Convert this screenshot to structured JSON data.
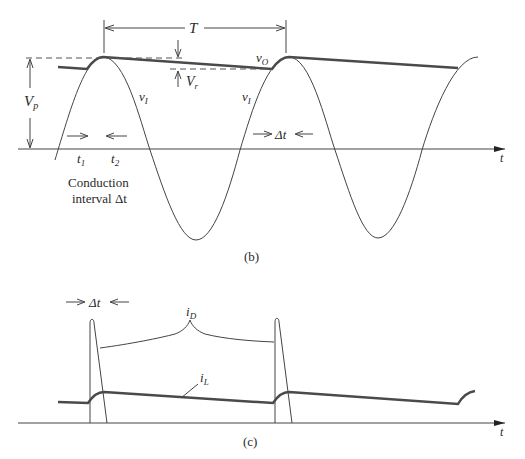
{
  "figure_b": {
    "caption": "(b)",
    "period_label": "T",
    "peak_label": "V",
    "peak_sub": "p",
    "ripple_label": "V",
    "ripple_sub": "r",
    "output_label": "v",
    "output_sub": "O",
    "input_label_1": "v",
    "input_sub_1": "I",
    "input_label_2": "v",
    "input_sub_2": "I",
    "t1_label": "t",
    "t1_sub": "1",
    "t2_label": "t",
    "t2_sub": "2",
    "delta_t_label": "Δt",
    "conduction_line1": "Conduction",
    "conduction_line2": "interval Δt",
    "axis_label": "t"
  },
  "figure_c": {
    "caption": "(c)",
    "delta_t_label": "Δt",
    "diode_current_label": "i",
    "diode_current_sub": "D",
    "load_current_label": "i",
    "load_current_sub": "L",
    "axis_label": "t"
  },
  "colors": {
    "line": "#3a3a3a",
    "thick_line": "#4a4a4a",
    "dashed": "#555555",
    "text": "#2a2a2a"
  }
}
